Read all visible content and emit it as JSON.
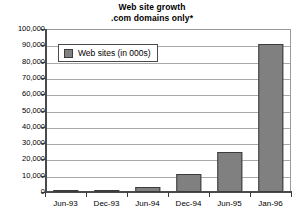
{
  "chart_data": {
    "type": "bar",
    "title": "Web site growth\n.com domains only*",
    "title_lines": [
      "Web site growth",
      ".com domains only*"
    ],
    "xlabel": "",
    "ylabel": "",
    "categories": [
      "Jun-93",
      "Dec-93",
      "Jun-94",
      "Dec-94",
      "Jun-95",
      "Jan-96"
    ],
    "values": [
      130,
      1500,
      3300,
      11000,
      24500,
      91000
    ],
    "series": [
      {
        "name": "Web sites (in 000s)",
        "values": [
          130,
          1500,
          3300,
          11000,
          24500,
          91000
        ]
      }
    ],
    "ylim": [
      0,
      100000
    ],
    "ytick_step": 10000,
    "ytick_labels": [
      "100,000",
      "90,000",
      "80,000",
      "70,000",
      "60,000",
      "50,000",
      "40,000",
      "30,000",
      "20,000",
      "10,000",
      "0"
    ],
    "ytick_values": [
      100000,
      90000,
      80000,
      70000,
      60000,
      50000,
      40000,
      30000,
      20000,
      10000,
      0
    ],
    "grid": true,
    "grid_axis": "y",
    "legend": {
      "position": "top-left-inside",
      "entries": [
        {
          "label": "Web sites (in 000s)",
          "color": "#808080"
        }
      ]
    },
    "colors": {
      "bar_fill": "#808080",
      "bar_border": "#3c3c3c",
      "gridline": "#a8a8a8",
      "axis": "#3a3a3a",
      "plot_border": "#9a9a9a",
      "background": "#ffffff",
      "text": "#000000"
    },
    "footnote_marker": "*"
  }
}
